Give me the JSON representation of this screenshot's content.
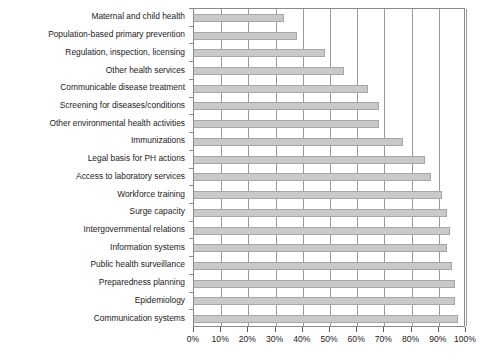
{
  "chart_data": {
    "type": "bar",
    "orientation": "horizontal",
    "title": "",
    "subtitle": "",
    "xlabel": "",
    "ylabel": "",
    "xlim": [
      0,
      100
    ],
    "grid": true,
    "grid_axis": "x",
    "legend": false,
    "legend_position": "none",
    "bar_color": "#c9c9c9",
    "bar_edge_color": "#a6a6a6",
    "axis_color": "#8a8a8a",
    "text_color": "#1b1b1b",
    "background": "#ffffff",
    "xticks": [
      0,
      10,
      20,
      30,
      40,
      50,
      60,
      70,
      80,
      90,
      100
    ],
    "xticklabels": [
      "0%",
      "10%",
      "20%",
      "30%",
      "40%",
      "50%",
      "60%",
      "70%",
      "80%",
      "90%",
      "100%"
    ],
    "categories": [
      "Maternal and child health",
      "Population-based primary prevention",
      "Regulation, inspection, licensing",
      "Other health services",
      "Communicable disease treatment",
      "Screening for diseases/conditions",
      "Other environmental health activities",
      "Immunizations",
      "Legal basis for PH actions",
      "Access to laboratory services",
      "Workforce training",
      "Surge capacity",
      "Intergovernmental relations",
      "Information systems",
      "Public health surveillance",
      "Preparedness planning",
      "Epidemiology",
      "Communication systems"
    ],
    "values": [
      33,
      38,
      48,
      55,
      64,
      68,
      68,
      77,
      85,
      87,
      91,
      93,
      94,
      93,
      95,
      96,
      96,
      97
    ]
  }
}
